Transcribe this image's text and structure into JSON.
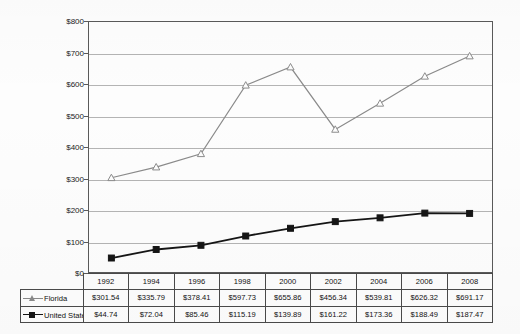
{
  "chart_data": {
    "type": "line",
    "title": "",
    "xlabel": "",
    "ylabel": "",
    "ylim": [
      0,
      800
    ],
    "ytick_step": 100,
    "grid": true,
    "legend_position": "table-left",
    "categories": [
      "1992",
      "1994",
      "1996",
      "1998",
      "2000",
      "2002",
      "2004",
      "2006",
      "2008"
    ],
    "ytick_labels": [
      "$800",
      "$700",
      "$600",
      "$500",
      "$400",
      "$300",
      "$200",
      "$100",
      "$0"
    ],
    "ytick_values": [
      800,
      700,
      600,
      500,
      400,
      300,
      200,
      100,
      0
    ],
    "series": [
      {
        "name": "Florida",
        "color": "#8a8a8a",
        "marker": "open-triangle",
        "values": [
          301.54,
          335.79,
          378.41,
          597.73,
          655.86,
          456.34,
          539.81,
          626.32,
          691.17
        ],
        "labels": [
          "$301.54",
          "$335.79",
          "$378.41",
          "$597.73",
          "$655.86",
          "$456.34",
          "$539.81",
          "$626.32",
          "$691.17"
        ]
      },
      {
        "name": "United States",
        "color": "#151515",
        "marker": "filled-square",
        "values": [
          44.74,
          72.04,
          85.46,
          115.19,
          139.89,
          161.22,
          173.36,
          188.49,
          187.47
        ],
        "labels": [
          "$44.74",
          "$72.04",
          "$85.46",
          "$115.19",
          "$139.89",
          "$161.22",
          "$173.36",
          "$188.49",
          "$187.47"
        ]
      }
    ]
  }
}
